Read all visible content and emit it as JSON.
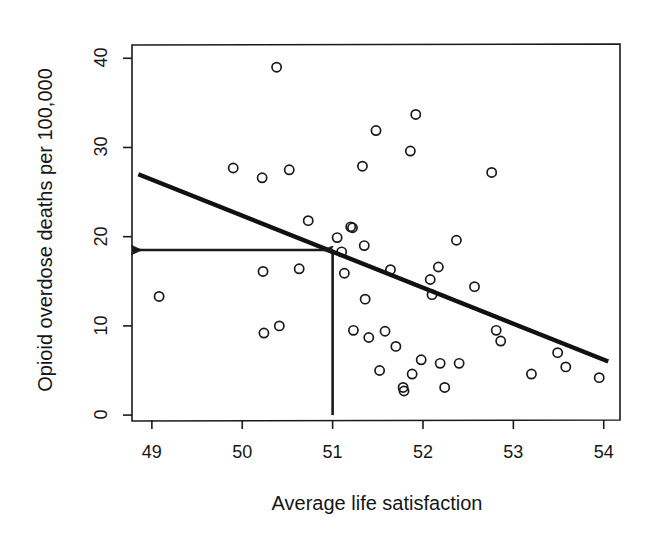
{
  "chart_data": {
    "type": "scatter",
    "title": "",
    "xlabel": "Average life satisfaction",
    "ylabel": "Opioid overdose deaths per 100,000",
    "xlim": [
      48.78,
      54.18
    ],
    "ylim": [
      -0.55,
      41.6
    ],
    "xticks": [
      49,
      50,
      51,
      52,
      53,
      54
    ],
    "xtick_labels": [
      "49",
      "50",
      "51",
      "52",
      "53",
      "54"
    ],
    "yticks": [
      0,
      10,
      20,
      30,
      40
    ],
    "ytick_labels": [
      "0",
      "10",
      "20",
      "30",
      "40"
    ],
    "grid": false,
    "legend": false,
    "marker": "open-circle",
    "points": [
      {
        "x": 49.08,
        "y": 13.3
      },
      {
        "x": 49.9,
        "y": 27.7
      },
      {
        "x": 50.22,
        "y": 26.6
      },
      {
        "x": 50.23,
        "y": 16.1
      },
      {
        "x": 50.24,
        "y": 9.2
      },
      {
        "x": 50.38,
        "y": 39.0
      },
      {
        "x": 50.41,
        "y": 10.0
      },
      {
        "x": 50.52,
        "y": 27.5
      },
      {
        "x": 50.63,
        "y": 16.4
      },
      {
        "x": 50.73,
        "y": 21.8
      },
      {
        "x": 51.05,
        "y": 19.9
      },
      {
        "x": 51.1,
        "y": 18.3
      },
      {
        "x": 51.13,
        "y": 15.9
      },
      {
        "x": 51.2,
        "y": 21.1
      },
      {
        "x": 51.22,
        "y": 21.0
      },
      {
        "x": 51.23,
        "y": 9.5
      },
      {
        "x": 51.33,
        "y": 27.9
      },
      {
        "x": 51.35,
        "y": 19.0
      },
      {
        "x": 51.36,
        "y": 13.0
      },
      {
        "x": 51.4,
        "y": 8.7
      },
      {
        "x": 51.48,
        "y": 31.9
      },
      {
        "x": 51.52,
        "y": 5.0
      },
      {
        "x": 51.58,
        "y": 9.4
      },
      {
        "x": 51.64,
        "y": 16.3
      },
      {
        "x": 51.7,
        "y": 7.7
      },
      {
        "x": 51.78,
        "y": 3.1
      },
      {
        "x": 51.79,
        "y": 2.7
      },
      {
        "x": 51.86,
        "y": 29.6
      },
      {
        "x": 51.88,
        "y": 4.6
      },
      {
        "x": 51.92,
        "y": 33.7
      },
      {
        "x": 51.98,
        "y": 6.2
      },
      {
        "x": 52.08,
        "y": 15.2
      },
      {
        "x": 52.1,
        "y": 13.5
      },
      {
        "x": 52.17,
        "y": 16.6
      },
      {
        "x": 52.19,
        "y": 5.8
      },
      {
        "x": 52.24,
        "y": 3.1
      },
      {
        "x": 52.37,
        "y": 19.6
      },
      {
        "x": 52.4,
        "y": 5.8
      },
      {
        "x": 52.57,
        "y": 14.4
      },
      {
        "x": 52.76,
        "y": 27.2
      },
      {
        "x": 52.81,
        "y": 9.5
      },
      {
        "x": 52.86,
        "y": 8.3
      },
      {
        "x": 53.2,
        "y": 4.6
      },
      {
        "x": 53.49,
        "y": 7.0
      },
      {
        "x": 53.58,
        "y": 5.4
      },
      {
        "x": 53.95,
        "y": 4.2
      }
    ],
    "trend_line": {
      "label": "regression-line",
      "x_start": 48.85,
      "y_start": 27.0,
      "x_end": 54.05,
      "y_end": 6.0
    },
    "annotation_arrows": [
      {
        "name": "vertical-guide-arrow",
        "from": {
          "x": 51.0,
          "y": 0.0
        },
        "to": {
          "x": 51.0,
          "y": 18.5
        },
        "head": "up"
      },
      {
        "name": "horizontal-guide-arrow",
        "from": {
          "x": 51.0,
          "y": 18.5
        },
        "to": {
          "x": 48.78,
          "y": 18.5
        },
        "head": "left"
      }
    ]
  },
  "style": {
    "axis_color": "#1a1a1a",
    "point_color": "#1a1a1a",
    "line_color": "#111111",
    "background": "#ffffff"
  }
}
